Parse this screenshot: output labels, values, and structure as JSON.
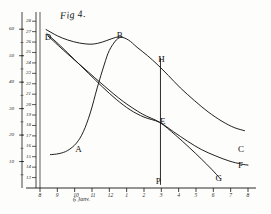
{
  "figure": {
    "title": "Fig 4.",
    "x_axis_caption": "6 Janv.",
    "ink_color": "#141414",
    "paper_color": "#fdfdfb"
  },
  "chart_data": {
    "type": "line",
    "title": "Fig 4.",
    "xlabel": "6 Janv.",
    "ylabel": "",
    "grid": false,
    "legend": "none",
    "x_tick_labels": [
      "8",
      "9",
      "10",
      "11",
      "12",
      "1",
      "2",
      "3",
      "4",
      "5",
      "6",
      "7",
      "8"
    ],
    "x_tick_values": [
      8,
      9,
      10,
      11,
      12,
      13,
      14,
      15,
      16,
      17,
      18,
      19,
      20
    ],
    "xlim": [
      8,
      20
    ],
    "left_scale_outer": {
      "name": "outer-scale",
      "tick_labels": [
        "60",
        "50",
        "40",
        "30",
        "20",
        "10"
      ],
      "values": [
        60,
        50,
        40,
        30,
        20,
        10
      ],
      "lim": [
        0,
        65
      ]
    },
    "left_scale_inner": {
      "name": "inner-scale",
      "tick_labels": [
        "28",
        "27",
        "26",
        "25",
        "24",
        "23",
        "22",
        "21",
        "20",
        "19",
        "18",
        "17",
        "16",
        "15",
        "14",
        "13"
      ],
      "values": [
        28,
        27,
        26,
        25,
        24,
        23,
        22,
        21,
        20,
        19,
        18,
        17,
        16,
        15,
        14,
        13
      ],
      "lim": [
        12,
        28.5
      ]
    },
    "annotations": [
      {
        "label": "D",
        "x": 8.45,
        "y": 26.4
      },
      {
        "label": "A",
        "x": 10.2,
        "y": 15.6
      },
      {
        "label": "B",
        "x": 12.6,
        "y": 26.6
      },
      {
        "label": "H",
        "x": 15.0,
        "y": 24.3
      },
      {
        "label": "E",
        "x": 15.1,
        "y": 18.3
      },
      {
        "label": "P",
        "x": 14.85,
        "y": 12.6
      },
      {
        "label": "C",
        "x": 19.6,
        "y": 15.6
      },
      {
        "label": "F",
        "x": 19.6,
        "y": 14.1
      },
      {
        "label": "G",
        "x": 18.3,
        "y": 12.9
      }
    ],
    "series": [
      {
        "name": "curve-DBC",
        "label_start": "D",
        "label_peak": "B",
        "label_end": "C",
        "points": [
          [
            8.35,
            27.2
          ],
          [
            9.0,
            26.6
          ],
          [
            9.6,
            26.2
          ],
          [
            10.3,
            25.9
          ],
          [
            11.0,
            25.8
          ],
          [
            11.6,
            26.0
          ],
          [
            12.1,
            26.3
          ],
          [
            12.6,
            26.5
          ],
          [
            13.1,
            26.2
          ],
          [
            13.6,
            25.5
          ],
          [
            14.2,
            24.7
          ],
          [
            14.8,
            23.8
          ],
          [
            15.4,
            22.8
          ],
          [
            16.1,
            21.6
          ],
          [
            16.9,
            20.4
          ],
          [
            17.7,
            19.3
          ],
          [
            18.5,
            18.4
          ],
          [
            19.2,
            17.8
          ],
          [
            19.8,
            17.5
          ]
        ]
      },
      {
        "name": "curve-ABC",
        "label_start": "A",
        "label_peak": "B",
        "points": [
          [
            8.6,
            15.2
          ],
          [
            9.1,
            15.3
          ],
          [
            9.6,
            15.6
          ],
          [
            10.1,
            16.3
          ],
          [
            10.5,
            17.4
          ],
          [
            10.9,
            19.2
          ],
          [
            11.3,
            21.6
          ],
          [
            11.7,
            23.8
          ],
          [
            12.0,
            25.2
          ],
          [
            12.4,
            26.2
          ],
          [
            12.7,
            26.5
          ]
        ]
      },
      {
        "name": "curve-DEF",
        "label_start": "D",
        "label_mid": "E",
        "label_end": "F",
        "points": [
          [
            8.4,
            26.8
          ],
          [
            9.2,
            25.6
          ],
          [
            10.0,
            24.3
          ],
          [
            10.8,
            23.0
          ],
          [
            11.6,
            21.7
          ],
          [
            12.4,
            20.5
          ],
          [
            13.2,
            19.5
          ],
          [
            14.0,
            18.8
          ],
          [
            14.9,
            18.3
          ],
          [
            15.7,
            17.4
          ],
          [
            16.5,
            16.5
          ],
          [
            17.3,
            15.7
          ],
          [
            18.1,
            15.1
          ],
          [
            18.9,
            14.6
          ],
          [
            19.6,
            14.3
          ],
          [
            20.0,
            14.2
          ]
        ]
      },
      {
        "name": "curve-DEG",
        "label_start": "D",
        "label_mid": "E",
        "label_end": "G",
        "points": [
          [
            8.45,
            26.6
          ],
          [
            9.5,
            25.0
          ],
          [
            10.6,
            23.4
          ],
          [
            11.7,
            21.8
          ],
          [
            12.8,
            20.3
          ],
          [
            13.9,
            19.1
          ],
          [
            14.9,
            18.3
          ],
          [
            15.8,
            17.1
          ],
          [
            16.6,
            15.9
          ],
          [
            17.3,
            14.8
          ],
          [
            17.9,
            13.8
          ],
          [
            18.4,
            12.9
          ]
        ]
      }
    ],
    "reference_line": {
      "name": "vertical-line-HEP",
      "x": 14.95,
      "from_label": "H",
      "to_label": "P",
      "y_top": 24.5,
      "y_bottom": 12.3
    }
  }
}
